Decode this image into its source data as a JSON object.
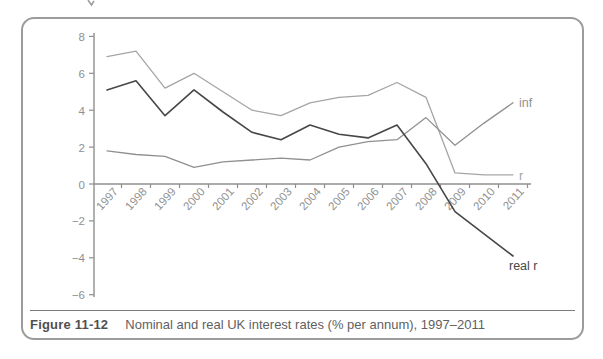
{
  "chart_data": {
    "type": "line",
    "title": "",
    "xlabel": "",
    "ylabel": "",
    "categories": [
      "1997",
      "1998",
      "1999",
      "2000",
      "2001",
      "2002",
      "2003",
      "2004",
      "2005",
      "2006",
      "2007",
      "2008",
      "2009",
      "2010",
      "2011"
    ],
    "series": [
      {
        "name": "r",
        "label": "r",
        "color": "#a5a5a5",
        "values": [
          6.9,
          7.2,
          5.2,
          6.0,
          5.0,
          4.0,
          3.7,
          4.4,
          4.7,
          4.8,
          5.5,
          4.7,
          0.6,
          0.5,
          0.5
        ]
      },
      {
        "name": "inf",
        "label": "inf",
        "color": "#909090",
        "values": [
          1.8,
          1.6,
          1.5,
          0.9,
          1.2,
          1.3,
          1.4,
          1.3,
          2.0,
          2.3,
          2.4,
          3.6,
          2.1,
          3.3,
          4.4
        ]
      },
      {
        "name": "real r",
        "label": "real r",
        "color": "#474747",
        "values": [
          5.1,
          5.6,
          3.7,
          5.1,
          3.9,
          2.8,
          2.4,
          3.2,
          2.7,
          2.5,
          3.2,
          1.1,
          -1.5,
          -2.7,
          -3.9
        ]
      }
    ],
    "ylim": [
      -6,
      8
    ],
    "yticks": [
      8,
      6,
      4,
      2,
      0,
      -2,
      -4,
      -6
    ],
    "grid": false,
    "legend_position": "line-end-labels",
    "axis_color": "#8f8f8f"
  },
  "caption": {
    "figure_label": "Figure 11-12",
    "text": "Nominal and real UK interest rates (% per annum), 1997–2011"
  }
}
